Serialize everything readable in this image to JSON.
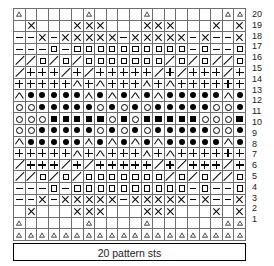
{
  "chart_data": {
    "type": "table",
    "title": "20 pattern sts",
    "xlabel": "20 pattern sts",
    "ylabel": "",
    "columns": 20,
    "rows": 20,
    "grid": true,
    "row_labels": [
      "20",
      "19",
      "18",
      "17",
      "16",
      "15",
      "14",
      "13",
      "12",
      "11",
      "10",
      "9",
      "8",
      "7",
      "6",
      "5",
      "4",
      "3",
      "2",
      "1"
    ],
    "legend": [
      {
        "key": "tri",
        "name": "triangle"
      },
      {
        "key": "x",
        "name": "cross"
      },
      {
        "key": "dash",
        "name": "dash"
      },
      {
        "key": "sq",
        "name": "open-square"
      },
      {
        "key": "fsq",
        "name": "filled-square"
      },
      {
        "key": "slash",
        "name": "diagonal"
      },
      {
        "key": "plus",
        "name": "plus"
      },
      {
        "key": "caret",
        "name": "caret"
      },
      {
        "key": "circ",
        "name": "open-circle"
      },
      {
        "key": "dot",
        "name": "filled-circle"
      },
      {
        "key": "blank",
        "name": "empty"
      }
    ],
    "cells": [
      [
        "tri",
        "blank",
        "blank",
        "blank",
        "blank",
        "blank",
        "tri",
        "blank",
        "blank",
        "blank",
        "blank",
        "tri",
        "blank",
        "blank",
        "blank",
        "blank",
        "blank",
        "blank",
        "tri",
        "tri"
      ],
      [
        "blank",
        "x",
        "blank",
        "blank",
        "blank",
        "x",
        "x",
        "x",
        "blank",
        "blank",
        "blank",
        "x",
        "x",
        "x",
        "blank",
        "blank",
        "blank",
        "x",
        "blank",
        "x"
      ],
      [
        "dash",
        "dash",
        "x",
        "dash",
        "x",
        "x",
        "x",
        "x",
        "x",
        "dash",
        "x",
        "x",
        "x",
        "x",
        "x",
        "dash",
        "x",
        "dash",
        "dash",
        "x"
      ],
      [
        "dash",
        "dash",
        "dash",
        "sq",
        "dash",
        "sq",
        "sq",
        "sq",
        "sq",
        "sq",
        "sq",
        "sq",
        "sq",
        "sq",
        "sq",
        "dash",
        "sq",
        "dash",
        "dash",
        "sq"
      ],
      [
        "slash",
        "slash",
        "sq",
        "slash",
        "sq",
        "slash",
        "sq",
        "sq",
        "sq",
        "sq",
        "sq",
        "sq",
        "sq",
        "slash",
        "sq",
        "slash",
        "sq",
        "slash",
        "slash",
        "sq"
      ],
      [
        "slash",
        "plus",
        "plus",
        "plus",
        "slash",
        "plus",
        "slash",
        "plus",
        "plus",
        "plus",
        "plus",
        "plus",
        "slash",
        "plus",
        "slash",
        "plus",
        "plus",
        "plus",
        "slash",
        "plus"
      ],
      [
        "plus",
        "plus",
        "plus",
        "plus",
        "plus",
        "caret",
        "plus",
        "caret",
        "plus",
        "plus",
        "plus",
        "caret",
        "plus",
        "caret",
        "plus",
        "plus",
        "plus",
        "plus",
        "plus",
        "plus"
      ],
      [
        "caret",
        "dot",
        "dot",
        "dot",
        "dot",
        "dot",
        "caret",
        "dot",
        "caret",
        "dot",
        "caret",
        "dot",
        "caret",
        "dot",
        "dot",
        "dot",
        "dot",
        "dot",
        "caret",
        "dot"
      ],
      [
        "circ",
        "circ",
        "dot",
        "dot",
        "dot",
        "dot",
        "dot",
        "circ",
        "dot",
        "circ",
        "dot",
        "circ",
        "dot",
        "dot",
        "dot",
        "dot",
        "dot",
        "circ",
        "circ",
        "dot"
      ],
      [
        "circ",
        "circ",
        "circ",
        "fsq",
        "fsq",
        "fsq",
        "fsq",
        "fsq",
        "circ",
        "fsq",
        "circ",
        "fsq",
        "fsq",
        "fsq",
        "fsq",
        "fsq",
        "circ",
        "circ",
        "circ",
        "fsq"
      ],
      [
        "circ",
        "circ",
        "dot",
        "dot",
        "dot",
        "dot",
        "dot",
        "circ",
        "dot",
        "circ",
        "dot",
        "circ",
        "dot",
        "dot",
        "dot",
        "dot",
        "dot",
        "circ",
        "circ",
        "dot"
      ],
      [
        "caret",
        "dot",
        "dot",
        "dot",
        "dot",
        "dot",
        "caret",
        "dot",
        "caret",
        "dot",
        "caret",
        "dot",
        "caret",
        "dot",
        "dot",
        "dot",
        "dot",
        "dot",
        "caret",
        "dot"
      ],
      [
        "plus",
        "plus",
        "plus",
        "plus",
        "plus",
        "caret",
        "plus",
        "caret",
        "plus",
        "plus",
        "plus",
        "caret",
        "plus",
        "caret",
        "plus",
        "plus",
        "plus",
        "plus",
        "plus",
        "plus"
      ],
      [
        "slash",
        "plus",
        "plus",
        "plus",
        "slash",
        "plus",
        "slash",
        "plus",
        "plus",
        "plus",
        "plus",
        "plus",
        "slash",
        "plus",
        "slash",
        "plus",
        "plus",
        "plus",
        "slash",
        "plus"
      ],
      [
        "slash",
        "slash",
        "sq",
        "slash",
        "sq",
        "slash",
        "sq",
        "sq",
        "sq",
        "sq",
        "sq",
        "sq",
        "sq",
        "slash",
        "sq",
        "slash",
        "sq",
        "slash",
        "slash",
        "sq"
      ],
      [
        "dash",
        "dash",
        "dash",
        "sq",
        "dash",
        "sq",
        "sq",
        "sq",
        "sq",
        "sq",
        "sq",
        "sq",
        "sq",
        "sq",
        "sq",
        "dash",
        "sq",
        "dash",
        "dash",
        "sq"
      ],
      [
        "dash",
        "dash",
        "x",
        "dash",
        "x",
        "x",
        "x",
        "x",
        "x",
        "dash",
        "x",
        "x",
        "x",
        "x",
        "x",
        "dash",
        "x",
        "dash",
        "dash",
        "x"
      ],
      [
        "blank",
        "x",
        "blank",
        "blank",
        "blank",
        "x",
        "x",
        "x",
        "blank",
        "blank",
        "blank",
        "x",
        "x",
        "x",
        "blank",
        "blank",
        "blank",
        "x",
        "blank",
        "x"
      ],
      [
        "tri",
        "blank",
        "blank",
        "blank",
        "blank",
        "blank",
        "tri",
        "blank",
        "blank",
        "blank",
        "blank",
        "tri",
        "blank",
        "blank",
        "blank",
        "blank",
        "blank",
        "blank",
        "tri",
        "tri"
      ],
      [
        "tri",
        "tri",
        "tri",
        "tri",
        "tri",
        "tri",
        "tri",
        "tri",
        "tri",
        "tri",
        "tri",
        "tri",
        "tri",
        "tri",
        "tri",
        "tri",
        "tri",
        "tri",
        "tri",
        "tri"
      ]
    ]
  },
  "footer": {
    "caption": "20 pattern sts"
  }
}
